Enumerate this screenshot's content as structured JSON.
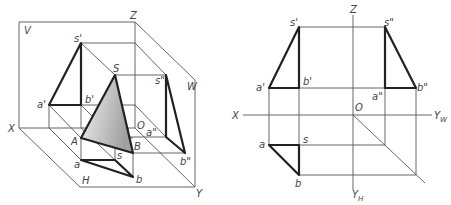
{
  "figure_left": {
    "title": "Isometric view of triangular pyramid in three projection planes",
    "planes": {
      "v": "V",
      "h": "H",
      "w": "W"
    },
    "axes": {
      "x": "X",
      "y": "Y",
      "z": "Z",
      "origin": "O"
    },
    "points": {
      "S": "S",
      "A": "A",
      "B": "B",
      "s_v": "s'",
      "a_v": "a'",
      "b_v": "b'",
      "s_h": "s",
      "a_h": "a",
      "b_h": "b",
      "s_w": "s\"",
      "a_w": "a\"",
      "b_w": "b\""
    }
  },
  "figure_right": {
    "title": "Three-view orthographic projection",
    "axes": {
      "x": "X",
      "z": "Z",
      "yw": "Y",
      "yw_sub": "W",
      "yh": "Y",
      "yh_sub": "H",
      "origin": "O"
    },
    "points": {
      "s_v": "s'",
      "a_v": "a'",
      "b_v": "b'",
      "s_w": "s\"",
      "a_w": "a\"",
      "b_w": "b\"",
      "s_h": "s",
      "a_h": "a",
      "b_h": "b"
    }
  },
  "colors": {
    "line": "#555555",
    "outline": "#222222",
    "shade_start": "#f2f2f2",
    "shade_end": "#a8a8a8"
  }
}
